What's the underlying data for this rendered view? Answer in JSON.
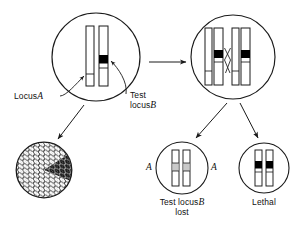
{
  "figure": {
    "type": "genetics-diagram",
    "title_visible": false,
    "background": "#ffffff",
    "stroke": "#1a1a1a",
    "band_dark": "#000000",
    "band_light": "#c9c9c9"
  },
  "labels": {
    "locus_a": "Locus",
    "locus_a_gene": "A",
    "test_locus_b_line1": "Test",
    "test_locus_b_line2": "locus",
    "test_locus_b_gene": "B",
    "bottom_mid_line1_pre": "Test locus",
    "bottom_mid_line1_gene": "B",
    "bottom_mid_line2": "lost",
    "bottom_right": "Lethal",
    "gene_a_left": "A",
    "gene_a_right": "A"
  },
  "cells": {
    "parent": {
      "name": "parent-cell",
      "cx": 96,
      "cy": 57,
      "r": 44,
      "chromatids": [
        {
          "x": 86,
          "y": 26,
          "w": 8,
          "h": 60,
          "bands": [
            {
              "y": 74,
              "h": 7,
              "fill": "#ffffff"
            }
          ]
        },
        {
          "x": 99,
          "y": 26,
          "w": 9,
          "h": 60,
          "bands": [
            {
              "y": 55,
              "h": 8,
              "fill": "#000000"
            },
            {
              "y": 63,
              "h": 5,
              "fill": "#ffffff"
            }
          ]
        }
      ]
    },
    "meiotic": {
      "name": "meiotic-cell",
      "cx": 233,
      "cy": 57,
      "r": 42,
      "chromatids": [
        {
          "x": 205,
          "y": 28,
          "w": 7,
          "h": 57,
          "bands": [
            {
              "y": 70,
              "h": 6,
              "fill": "#ffffff"
            }
          ]
        },
        {
          "x": 214,
          "y": 28,
          "w": 9,
          "h": 57,
          "bands": [
            {
              "y": 50,
              "h": 8,
              "fill": "#000000"
            },
            {
              "y": 58,
              "h": 4,
              "fill": "#ffffff"
            }
          ]
        },
        {
          "x": 232,
          "y": 28,
          "w": 7,
          "h": 57,
          "bands": [
            {
              "y": 70,
              "h": 6,
              "fill": "#ffffff"
            }
          ]
        },
        {
          "x": 241,
          "y": 28,
          "w": 9,
          "h": 57,
          "bands": [
            {
              "y": 50,
              "h": 8,
              "fill": "#000000"
            },
            {
              "y": 58,
              "h": 4,
              "fill": "#ffffff"
            }
          ]
        }
      ],
      "crossover": true
    },
    "colony": {
      "name": "colony-cell-patch",
      "cx": 44,
      "cy": 170,
      "r": 28,
      "sector_dark": true
    },
    "locus_lost": {
      "name": "locus-lost-cell",
      "cx": 182,
      "cy": 168,
      "r": 26,
      "chromatids": [
        {
          "x": 172,
          "y": 150,
          "w": 7,
          "h": 36,
          "bands": [
            {
              "y": 163,
              "h": 8,
              "fill": "#c9c9c9"
            }
          ]
        },
        {
          "x": 183,
          "y": 150,
          "w": 7,
          "h": 36,
          "bands": [
            {
              "y": 163,
              "h": 8,
              "fill": "#c9c9c9"
            }
          ]
        }
      ]
    },
    "lethal": {
      "name": "lethal-cell",
      "cx": 264,
      "cy": 168,
      "r": 25,
      "chromatids": [
        {
          "x": 255,
          "y": 150,
          "w": 7,
          "h": 36,
          "bands": [
            {
              "y": 161,
              "h": 7,
              "fill": "#000000"
            },
            {
              "y": 168,
              "h": 4,
              "fill": "#ffffff"
            }
          ]
        },
        {
          "x": 266,
          "y": 150,
          "w": 7,
          "h": 36,
          "bands": [
            {
              "y": 161,
              "h": 7,
              "fill": "#000000"
            },
            {
              "y": 168,
              "h": 4,
              "fill": "#ffffff"
            }
          ]
        }
      ]
    }
  },
  "arrows": [
    {
      "name": "arrow-parent-to-meiotic",
      "x1": 147,
      "y1": 62,
      "x2": 186,
      "y2": 62
    },
    {
      "name": "arrow-parent-to-colony",
      "x1": 84,
      "y1": 106,
      "x2": 57,
      "y2": 140
    },
    {
      "name": "arrow-meiotic-to-locus-lost",
      "x1": 227,
      "y1": 104,
      "x2": 194,
      "y2": 139
    },
    {
      "name": "arrow-meiotic-to-lethal",
      "x1": 240,
      "y1": 104,
      "x2": 258,
      "y2": 139
    },
    {
      "name": "pointer-locus-a",
      "target": "left-chromatid-band"
    },
    {
      "name": "pointer-test-locus-b",
      "target": "right-chromatid-dark-band"
    }
  ]
}
